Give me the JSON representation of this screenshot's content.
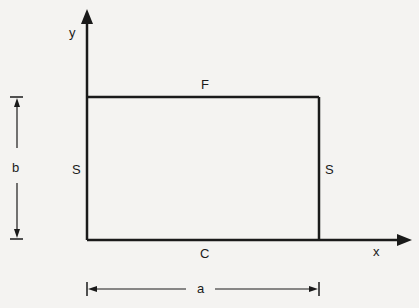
{
  "diagram": {
    "axes": {
      "x_label": "x",
      "y_label": "y"
    },
    "edges": {
      "top": "F",
      "left": "S",
      "right": "S",
      "bottom": "C"
    },
    "dimensions": {
      "width": "a",
      "height": "b"
    },
    "colors": {
      "ink": "#1a1a1a",
      "background": "#f4f3f1"
    }
  }
}
